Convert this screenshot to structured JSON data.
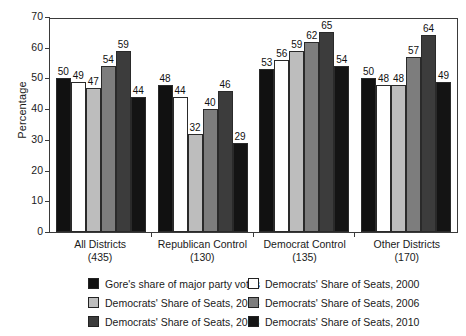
{
  "chart_data": {
    "type": "bar",
    "title": "",
    "xlabel": "",
    "ylabel": "Percentage",
    "ylim": [
      0,
      70
    ],
    "yticks": [
      0,
      10,
      20,
      30,
      40,
      50,
      60,
      70
    ],
    "grid": false,
    "legend_position": "bottom",
    "categories": [
      "All Districts",
      "Republican Control",
      "Democrat Control",
      "Other Districts"
    ],
    "category_counts": [
      "(435)",
      "(130)",
      "(135)",
      "(170)"
    ],
    "series": [
      {
        "name": "Gore's share of major party votes",
        "color": "#111111",
        "values": [
          50,
          48,
          53,
          50
        ]
      },
      {
        "name": "Democrats' Share of Seats, 2000",
        "color": "#ffffff",
        "values": [
          49,
          44,
          56,
          48
        ]
      },
      {
        "name": "Democrats' Share of Seats, 2004",
        "color": "#bdbdbd",
        "values": [
          47,
          32,
          59,
          48
        ]
      },
      {
        "name": "Democrats' Share of Seats, 2006",
        "color": "#7d7d7d",
        "values": [
          54,
          40,
          62,
          57
        ]
      },
      {
        "name": "Democrats' Share of Seats, 2008",
        "color": "#3c3c3c",
        "values": [
          59,
          46,
          65,
          64
        ]
      },
      {
        "name": "Democrats' Share of Seats, 2010",
        "color": "#141414",
        "values": [
          44,
          29,
          54,
          49
        ]
      }
    ]
  }
}
